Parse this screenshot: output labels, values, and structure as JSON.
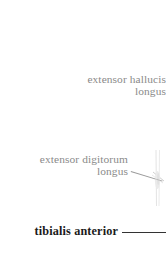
{
  "figure": {
    "background_color": "#ffffff",
    "width": 166,
    "height": 253
  },
  "labels": [
    {
      "id": "extensor-hallucis-longus",
      "line1": "extensor hallucis",
      "line2": "longus",
      "color": "#8a8a8a",
      "weight": "regular",
      "align": "right",
      "has_leader_line": false
    },
    {
      "id": "extensor-digitorum-longus",
      "line1": "extensor digitorum",
      "line2": "longus",
      "color": "#8a8a8a",
      "weight": "regular",
      "align": "right",
      "has_leader_line": true,
      "leader_color": "#9a9a9a"
    },
    {
      "id": "tibialis-anterior",
      "line1": "tibialis anterior",
      "line2": "",
      "color": "#1a1a1a",
      "weight": "bold",
      "align": "right",
      "has_leader_line": true,
      "leader_color": "#333333"
    }
  ]
}
